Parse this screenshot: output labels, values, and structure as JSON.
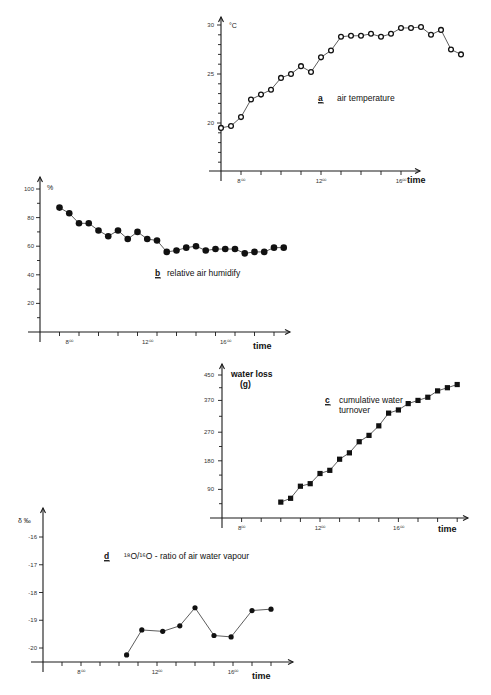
{
  "chart_data": [
    {
      "id": "a",
      "type": "line",
      "panel_letter": "a",
      "title": "air temperature",
      "ylabel": "°C",
      "xlabel": "time",
      "marker": "open-circle",
      "ylim": [
        15,
        30
      ],
      "yticks": [
        20,
        25,
        30
      ],
      "xticks": [
        {
          "x": 8,
          "label": "8⁰⁰"
        },
        {
          "x": 12,
          "label": "12⁰⁰"
        },
        {
          "x": 16,
          "label": "16⁰⁰"
        }
      ],
      "x": [
        7.0,
        7.5,
        8.0,
        8.5,
        9.0,
        9.5,
        10.0,
        10.5,
        11.0,
        11.5,
        12.0,
        12.5,
        13.0,
        13.5,
        14.0,
        14.5,
        15.0,
        15.5,
        16.0,
        16.5,
        17.0,
        17.5,
        18.0,
        18.5,
        19.0
      ],
      "values": [
        19.5,
        19.7,
        20.6,
        22.4,
        22.9,
        23.4,
        24.6,
        25.0,
        25.8,
        25.2,
        26.7,
        27.4,
        28.8,
        28.9,
        28.9,
        29.1,
        28.8,
        29.1,
        29.7,
        29.7,
        29.8,
        29.0,
        29.5,
        27.5,
        27.0
      ]
    },
    {
      "id": "b",
      "type": "line",
      "panel_letter": "b",
      "title": "relative air humidify",
      "ylabel": "%",
      "xlabel": "time",
      "marker": "filled-circle",
      "ylim": [
        0,
        100
      ],
      "yticks": [
        20,
        40,
        60,
        80,
        100
      ],
      "xticks": [
        {
          "x": 8,
          "label": "8⁰⁰"
        },
        {
          "x": 12,
          "label": "12⁰⁰"
        },
        {
          "x": 16,
          "label": "16⁰⁰"
        }
      ],
      "x": [
        7.5,
        8.0,
        8.5,
        9.0,
        9.5,
        10.0,
        10.5,
        11.0,
        11.5,
        12.0,
        12.5,
        13.0,
        13.5,
        14.0,
        14.5,
        15.0,
        15.5,
        16.0,
        16.5,
        17.0,
        17.5,
        18.0,
        18.5,
        19.0
      ],
      "values": [
        87,
        83,
        76,
        76,
        71,
        67,
        71,
        65,
        70,
        65,
        64,
        56,
        57,
        59,
        60,
        57,
        58,
        58,
        58,
        55,
        56,
        56,
        59,
        59
      ]
    },
    {
      "id": "c",
      "type": "line",
      "panel_letter": "c",
      "title": "cumulative water turnover",
      "ylabel": "water loss (g)",
      "xlabel": "time",
      "marker": "filled-square",
      "ylim": [
        0,
        450
      ],
      "yticks": [
        90,
        180,
        270,
        370,
        450
      ],
      "xticks": [
        {
          "x": 8,
          "label": "8⁰⁰"
        },
        {
          "x": 12,
          "label": "12⁰⁰"
        },
        {
          "x": 16,
          "label": "16⁰⁰"
        }
      ],
      "x": [
        10.0,
        10.5,
        11.0,
        11.5,
        12.0,
        12.5,
        13.0,
        13.5,
        14.0,
        14.5,
        15.0,
        15.5,
        16.0,
        16.5,
        17.0,
        17.5,
        18.0,
        18.5,
        19.0
      ],
      "values": [
        50,
        62,
        100,
        108,
        140,
        150,
        185,
        205,
        240,
        260,
        290,
        330,
        340,
        360,
        370,
        380,
        400,
        410,
        420
      ]
    },
    {
      "id": "d",
      "type": "line",
      "panel_letter": "d",
      "title": "¹⁸O/¹⁶O - ratio of air water vapour",
      "ylabel": "δ ‰",
      "xlabel": "time",
      "marker": "filled-circle",
      "ylim": [
        -20.5,
        -15.5
      ],
      "yticks": [
        -20,
        -19,
        -18,
        -17,
        -16
      ],
      "xticks": [
        {
          "x": 8,
          "label": "8⁰⁰"
        },
        {
          "x": 12,
          "label": "12⁰⁰"
        },
        {
          "x": 16,
          "label": "16⁰⁰"
        }
      ],
      "x": [
        10.4,
        11.2,
        12.3,
        13.2,
        14.0,
        15.0,
        15.9,
        17.0,
        18.0
      ],
      "values": [
        -20.25,
        -19.35,
        -19.4,
        -19.2,
        -18.55,
        -19.55,
        -19.6,
        -18.65,
        -18.6
      ]
    }
  ]
}
